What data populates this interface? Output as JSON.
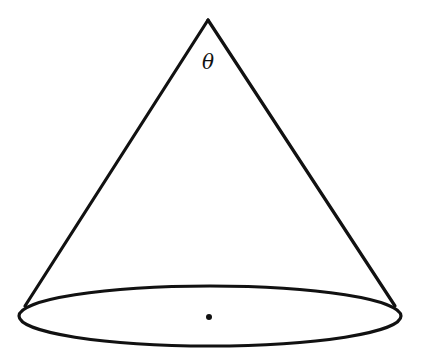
{
  "diagram": {
    "type": "cone",
    "labels": {
      "apex_angle": "θ"
    },
    "colors": {
      "stroke": "#111111",
      "background": "#ffffff"
    },
    "geometry": {
      "apex": [
        208,
        20
      ],
      "base_center": [
        209,
        317
      ],
      "base_rx": 191,
      "base_ry": 30,
      "left_tangent": [
        25,
        306
      ],
      "right_tangent": [
        395,
        306
      ]
    }
  }
}
